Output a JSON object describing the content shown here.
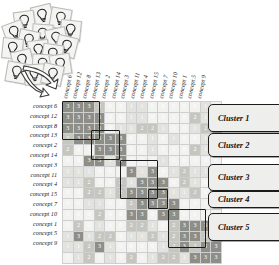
{
  "figure": {
    "source_icon": "lightbulb-note-pile"
  },
  "matrix": {
    "row_labels": [
      "concept 6",
      "concept 12",
      "concept 8",
      "concept 13",
      "concept 2",
      "concept 14",
      "concept 3",
      "concept 11",
      "concept 4",
      "concept 15",
      "concept 7",
      "concept 10",
      "concept 1",
      "concept 5",
      "concept 9"
    ],
    "col_labels": [
      "concept 6",
      "concept 12",
      "concept 8",
      "concept 13",
      "concept 2",
      "concept 14",
      "concept 3",
      "concept 11",
      "concept 4",
      "concept 15",
      "concept 7",
      "concept 10",
      "concept 1",
      "concept 5",
      "concept 9"
    ],
    "value_scale": [
      0,
      1,
      2,
      3
    ],
    "values": [
      [
        3,
        3,
        3,
        2,
        0,
        0,
        1,
        1,
        0,
        0,
        0,
        0,
        0,
        1,
        0
      ],
      [
        3,
        3,
        3,
        3,
        0,
        0,
        1,
        1,
        0,
        0,
        0,
        0,
        2,
        1,
        1
      ],
      [
        3,
        3,
        3,
        3,
        0,
        1,
        1,
        2,
        2,
        1,
        0,
        0,
        1,
        2,
        2
      ],
      [
        2,
        3,
        3,
        3,
        3,
        3,
        0,
        0,
        1,
        0,
        1,
        0,
        0,
        1,
        0
      ],
      [
        2,
        0,
        0,
        3,
        3,
        3,
        0,
        0,
        1,
        0,
        0,
        0,
        2,
        1,
        1
      ],
      [
        0,
        0,
        3,
        3,
        1,
        3,
        0,
        0,
        0,
        1,
        0,
        0,
        0,
        0,
        0
      ],
      [
        1,
        1,
        1,
        0,
        0,
        0,
        3,
        1,
        3,
        0,
        1,
        2,
        1,
        1,
        0
      ],
      [
        1,
        1,
        2,
        0,
        0,
        2,
        1,
        3,
        3,
        3,
        0,
        2,
        1,
        0,
        0
      ],
      [
        0,
        0,
        2,
        2,
        1,
        2,
        3,
        3,
        3,
        3,
        1,
        1,
        2,
        0,
        1
      ],
      [
        0,
        0,
        1,
        1,
        0,
        0,
        2,
        3,
        3,
        3,
        3,
        0,
        0,
        0,
        0
      ],
      [
        0,
        0,
        0,
        2,
        0,
        0,
        3,
        3,
        0,
        3,
        3,
        0,
        0,
        0,
        0
      ],
      [
        0,
        2,
        0,
        1,
        0,
        0,
        2,
        2,
        1,
        0,
        2,
        3,
        3,
        3,
        1
      ],
      [
        1,
        3,
        1,
        2,
        2,
        0,
        1,
        1,
        2,
        1,
        2,
        3,
        3,
        2,
        3
      ],
      [
        1,
        1,
        2,
        3,
        1,
        0,
        0,
        0,
        0,
        1,
        2,
        3,
        2,
        3,
        3
      ],
      [
        0,
        1,
        2,
        0,
        1,
        0,
        2,
        0,
        1,
        2,
        2,
        1,
        3,
        3,
        3
      ]
    ]
  },
  "clusters": [
    {
      "label": "Cluster 1",
      "rows": [
        0,
        3
      ],
      "cols": [
        0,
        3
      ]
    },
    {
      "label": "Cluster 2",
      "rows": [
        3,
        5
      ],
      "cols": [
        3,
        5
      ]
    },
    {
      "label": "Cluster 3",
      "rows": [
        6,
        9
      ],
      "cols": [
        6,
        9
      ]
    },
    {
      "label": "Cluster 4",
      "rows": [
        9,
        10
      ],
      "cols": [
        9,
        10
      ]
    },
    {
      "label": "Cluster 5",
      "rows": [
        11,
        14
      ],
      "cols": [
        11,
        14
      ]
    }
  ],
  "cluster_labels": [
    {
      "text": "Cluster 1",
      "top": 104,
      "height": 26
    },
    {
      "text": "Cluster 2",
      "top": 133,
      "height": 22
    },
    {
      "text": "Cluster 3",
      "top": 164,
      "height": 25
    },
    {
      "text": "Cluster 4",
      "top": 191,
      "height": 15
    },
    {
      "text": "Cluster 5",
      "top": 213,
      "height": 26
    }
  ],
  "notes": {
    "count": 18,
    "icon": "lightbulb-icon"
  },
  "arrows": {
    "count": 2,
    "icon": "curved-arrow-icon"
  },
  "colors": {
    "v0": "#f2f2f0",
    "v1": "#e2e2de",
    "v2": "#c6c6c1",
    "v3": "#8e8e88",
    "outline": "#1b1b1b",
    "label_bg": "#eeeeec"
  }
}
